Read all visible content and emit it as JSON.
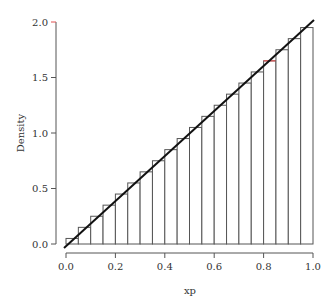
{
  "chart_data": {
    "type": "bar",
    "subtype": "histogram_with_density_line",
    "title": "",
    "xlabel": "xp",
    "ylabel": "Density",
    "xlim": [
      0,
      1
    ],
    "ylim": [
      0,
      2
    ],
    "xticks": [
      "0.0",
      "0.2",
      "0.4",
      "0.6",
      "0.8",
      "1.0"
    ],
    "yticks": [
      "0.0",
      "0.5",
      "1.0",
      "1.5",
      "2.0"
    ],
    "grid": false,
    "legend": null,
    "bin_width": 0.05,
    "bin_edges": [
      0.0,
      0.05,
      0.1,
      0.15,
      0.2,
      0.25,
      0.3,
      0.35,
      0.4,
      0.45,
      0.5,
      0.55,
      0.6,
      0.65,
      0.7,
      0.75,
      0.8,
      0.85,
      0.9,
      0.95,
      1.0
    ],
    "values": [
      0.05,
      0.15,
      0.25,
      0.35,
      0.45,
      0.55,
      0.65,
      0.75,
      0.85,
      0.95,
      1.05,
      1.15,
      1.25,
      1.35,
      1.45,
      1.55,
      1.65,
      1.75,
      1.85,
      1.95
    ],
    "highlighted_bin_index": 16,
    "density_line": {
      "x": [
        0,
        1
      ],
      "y": [
        0,
        2
      ],
      "label": "2x"
    },
    "colors": {
      "bar_edge": "#555555",
      "bar_fill": "#ffffff",
      "line": "#111111",
      "highlight": "#e05050",
      "axis": "#555555"
    }
  }
}
